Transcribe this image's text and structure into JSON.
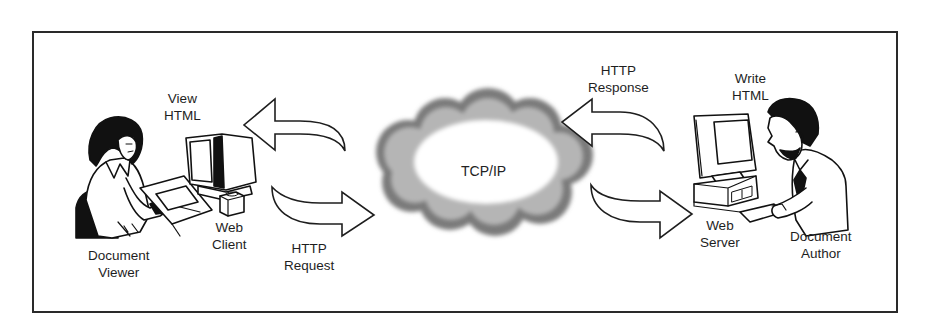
{
  "diagram": {
    "type": "web-communication-flow",
    "nodes": [
      {
        "id": "document-viewer",
        "label_lines": [
          "Document",
          "Viewer"
        ]
      },
      {
        "id": "web-client",
        "label_lines": [
          "Web",
          "Client"
        ]
      },
      {
        "id": "view-html",
        "label_lines": [
          "View",
          "HTML"
        ]
      },
      {
        "id": "network",
        "label": "TCP/IP"
      },
      {
        "id": "web-server",
        "label_lines": [
          "Web",
          "Server"
        ]
      },
      {
        "id": "write-html",
        "label_lines": [
          "Write",
          "HTML"
        ]
      },
      {
        "id": "document-author",
        "label_lines": [
          "Document",
          "Author"
        ]
      }
    ],
    "edges": [
      {
        "id": "http-request",
        "label_lines": [
          "HTTP",
          "Request"
        ],
        "from": "web-client",
        "to": "network"
      },
      {
        "id": "client-return",
        "from": "network",
        "to": "web-client"
      },
      {
        "id": "http-response",
        "label_lines": [
          "HTTP",
          "Response"
        ],
        "from": "web-server",
        "to": "network"
      },
      {
        "id": "server-incoming",
        "from": "network",
        "to": "web-server"
      }
    ]
  },
  "labels": {
    "view_html": [
      "View",
      "HTML"
    ],
    "web_client": [
      "Web",
      "Client"
    ],
    "document_viewer": [
      "Document",
      "Viewer"
    ],
    "http_request": [
      "HTTP",
      "Request"
    ],
    "tcp_ip": "TCP/IP",
    "http_response": [
      "HTTP",
      "Response"
    ],
    "write_html": [
      "Write",
      "HTML"
    ],
    "web_server": [
      "Web",
      "Server"
    ],
    "document_author": [
      "Document",
      "Author"
    ]
  },
  "colors": {
    "line": "#1e1e1e",
    "frame": "#2a2a2a",
    "cloud_edge": "#6a6a6a",
    "background": "#ffffff"
  }
}
